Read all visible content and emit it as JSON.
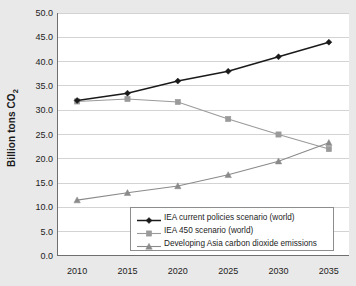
{
  "chart_data": {
    "type": "line",
    "title": "",
    "xlabel": "",
    "ylabel": "Billion tons CO2",
    "ylabel_prefix": "Billion tons CO",
    "ylabel_sub": "2",
    "categories": [
      2010,
      2015,
      2020,
      2025,
      2030,
      2035
    ],
    "xtick_labels": [
      "2010",
      "2015",
      "2020",
      "2025",
      "2030",
      "2035"
    ],
    "ytick_labels": [
      "0.0",
      "5.0",
      "10.0",
      "15.0",
      "20.0",
      "25.0",
      "30.0",
      "35.0",
      "40.0",
      "45.0",
      "50.0"
    ],
    "ytick_values": [
      0,
      5,
      10,
      15,
      20,
      25,
      30,
      35,
      40,
      45,
      50
    ],
    "ylim": [
      0,
      50
    ],
    "xlim": [
      2008,
      2037
    ],
    "grid": true,
    "grid_axis": "y",
    "legend_position": "lower-right-inside",
    "series": [
      {
        "name": "IEA current policies scenario (world)",
        "values": [
          32.0,
          33.5,
          36.0,
          38.0,
          41.0,
          44.0
        ],
        "color": "#1a1a1a",
        "marker": "diamond"
      },
      {
        "name": "IEA 450 scenario (world)",
        "values": [
          31.8,
          32.3,
          31.7,
          28.2,
          25.0,
          22.0
        ],
        "color": "#9a9a9a",
        "marker": "square"
      },
      {
        "name": "Developing Asia carbon dioxide emissions",
        "values": [
          11.5,
          13.0,
          14.4,
          16.7,
          19.5,
          23.3
        ],
        "color": "#8a8a8a",
        "marker": "triangle"
      }
    ]
  },
  "colors": {
    "page_background": "#e9e9e9",
    "plot_background": "#ffffff",
    "gridline": "#d3d3d3",
    "axis": "#6f6f6f",
    "text": "#1c1c1c",
    "legend_border": "#8d8d8d"
  }
}
